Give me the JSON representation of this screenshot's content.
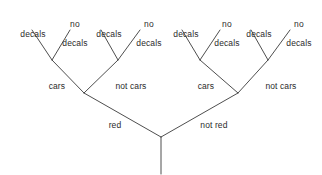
{
  "diagram": {
    "style": {
      "line_color": "#3a3a3a",
      "line_width": 0.9,
      "text_color": "#2b2b2b",
      "background": "#ffffff"
    },
    "root": {
      "stem_label": ""
    },
    "labels": {
      "red": "red",
      "not_red": "not red",
      "cars": "cars",
      "not_cars": "not cars",
      "decals": "decals",
      "no_decals_line1": "no",
      "no_decals_line2": "decals"
    },
    "levels": [
      {
        "name": "level-1-color",
        "nodes": [
          "red",
          "not red"
        ]
      },
      {
        "name": "level-2-vehicle",
        "nodes": [
          "cars",
          "not cars",
          "cars",
          "not cars"
        ]
      },
      {
        "name": "level-3-decals",
        "nodes": [
          "decals",
          "no decals",
          "decals",
          "no decals",
          "decals",
          "no decals",
          "decals",
          "no decals"
        ]
      }
    ],
    "leaves": [
      {
        "id": "leaf-1",
        "text": "decals",
        "two_line": false,
        "x": 28,
        "y": 22
      },
      {
        "id": "leaf-2",
        "text": "no decals",
        "two_line": true,
        "x": 70,
        "y": 12
      },
      {
        "id": "leaf-3",
        "text": "decals",
        "two_line": false,
        "x": 104,
        "y": 22
      },
      {
        "id": "leaf-4",
        "text": "no decals",
        "two_line": true,
        "x": 144,
        "y": 12
      },
      {
        "id": "leaf-5",
        "text": "decals",
        "two_line": false,
        "x": 181,
        "y": 22
      },
      {
        "id": "leaf-6",
        "text": "no decals",
        "two_line": true,
        "x": 222,
        "y": 12
      },
      {
        "id": "leaf-7",
        "text": "decals",
        "two_line": false,
        "x": 254,
        "y": 22
      },
      {
        "id": "leaf-8",
        "text": "no decals",
        "two_line": true,
        "x": 294,
        "y": 12
      }
    ],
    "branches": [
      {
        "id": "branch-cars-left",
        "text": "cars",
        "x": 52,
        "y": 74
      },
      {
        "id": "branch-not-cars-left",
        "text": "not cars",
        "x": 125,
        "y": 74
      },
      {
        "id": "branch-cars-right",
        "text": "cars",
        "x": 200,
        "y": 74
      },
      {
        "id": "branch-not-cars-right",
        "text": "not cars",
        "x": 275,
        "y": 74
      },
      {
        "id": "branch-red",
        "text": "red",
        "x": 109,
        "y": 113
      },
      {
        "id": "branch-not-red",
        "text": "not red",
        "x": 208,
        "y": 113
      }
    ]
  }
}
